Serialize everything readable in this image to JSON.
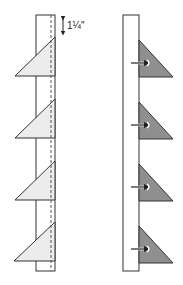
{
  "diagram": {
    "measurement_label": "1¼\"",
    "left_panel": {
      "description": "Strip with four light triangles sewn along dashed seam line",
      "strip": {
        "x": 36,
        "y": 15,
        "w": 19,
        "h": 256
      },
      "seam_x": 51,
      "triangles": [
        {
          "top": 37,
          "bottom": 76,
          "left_x": 15
        },
        {
          "top": 99,
          "bottom": 138,
          "left_x": 15
        },
        {
          "top": 161,
          "bottom": 200,
          "left_x": 15
        },
        {
          "top": 222,
          "bottom": 261,
          "left_x": 14
        }
      ],
      "fill": "#ececec"
    },
    "right_panel": {
      "description": "Strip with four dark triangles pressed outward, arrows indicating press direction",
      "strip": {
        "x": 123,
        "y": 15,
        "w": 16,
        "h": 256
      },
      "triangles": [
        {
          "top": 40,
          "bottom": 77,
          "right_x": 173
        },
        {
          "top": 102,
          "bottom": 139,
          "right_x": 173
        },
        {
          "top": 164,
          "bottom": 201,
          "right_x": 173
        },
        {
          "top": 226,
          "bottom": 263,
          "right_x": 173
        }
      ],
      "fill": "#8f8f8f"
    },
    "colors": {
      "stroke": "#333333",
      "light_fill": "#ececec",
      "dark_fill": "#8f8f8f"
    }
  }
}
